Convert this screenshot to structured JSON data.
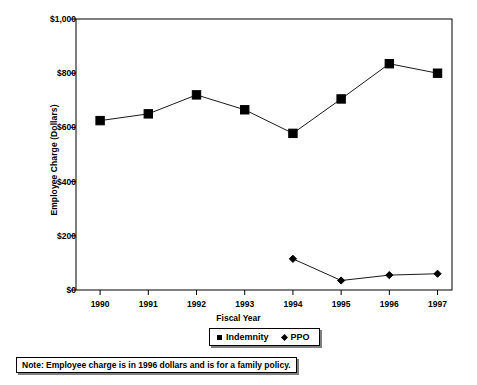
{
  "chart_data": {
    "type": "line",
    "title": "",
    "xlabel": "Fiscal Year",
    "ylabel": "Employee Charge (Dollars)",
    "categories": [
      "1990",
      "1991",
      "1992",
      "1993",
      "1994",
      "1995",
      "1996",
      "1997"
    ],
    "x": [
      1990,
      1991,
      1992,
      1993,
      1994,
      1995,
      1996,
      1997
    ],
    "xlim": [
      1989.5,
      1997.3
    ],
    "ylim": [
      0,
      1000
    ],
    "ytick_values": [
      0,
      200,
      400,
      600,
      800,
      1000
    ],
    "ytick_labels": [
      "$0",
      "$200",
      "$400",
      "$600",
      "$800",
      "$1,000"
    ],
    "grid": false,
    "legend_position": "bottom-center",
    "series": [
      {
        "name": "Indemnity",
        "marker": "square",
        "color": "#000000",
        "x": [
          1990,
          1991,
          1992,
          1993,
          1994,
          1995,
          1996,
          1997
        ],
        "values": [
          625,
          650,
          720,
          665,
          578,
          705,
          835,
          800
        ]
      },
      {
        "name": "PPO",
        "marker": "diamond",
        "color": "#000000",
        "x": [
          1994,
          1995,
          1996,
          1997
        ],
        "values": [
          115,
          35,
          55,
          60
        ]
      }
    ],
    "annotations": [
      "Note: Employee charge is in 1996 dollars and is for a family policy."
    ]
  },
  "legend": {
    "entries": [
      {
        "label": "Indemnity",
        "marker": "square"
      },
      {
        "label": "PPO",
        "marker": "diamond"
      }
    ]
  },
  "note": {
    "text": "Note: Employee charge is in 1996 dollars and is for a family policy."
  },
  "axes": {
    "y_title": "Employee Charge (Dollars)",
    "x_title": "Fiscal Year"
  }
}
